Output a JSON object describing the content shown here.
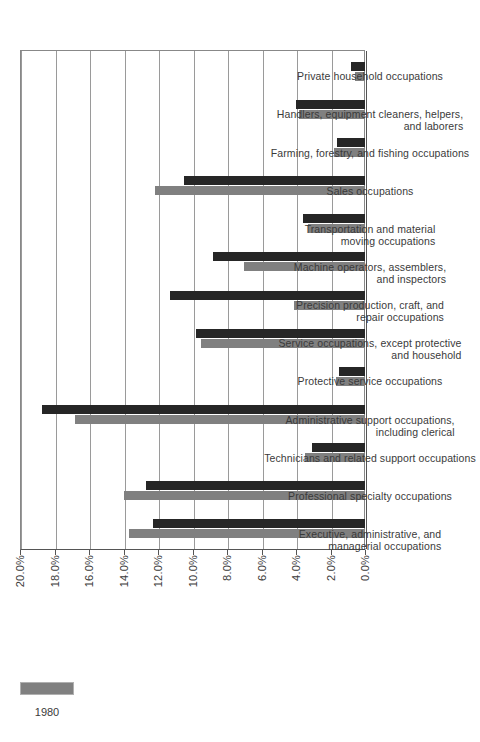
{
  "chart_data": {
    "type": "bar",
    "title": "",
    "xlabel": "",
    "ylabel": "",
    "ylim": [
      0.0,
      20.0
    ],
    "grid": true,
    "legend_position": "bottom-right",
    "ytick_labels": [
      "0.0%",
      "2.0%",
      "4.0%",
      "6.0%",
      "8.0%",
      "10.0%",
      "12.0%",
      "14.0%",
      "16.0%",
      "18.0%",
      "20.0%"
    ],
    "ytick_values": [
      0.0,
      2.0,
      4.0,
      6.0,
      8.0,
      10.0,
      12.0,
      14.0,
      16.0,
      18.0,
      20.0
    ],
    "categories": [
      {
        "line1": "Executive, administrative, and",
        "line2": "managerial occupations"
      },
      {
        "line1": "Professional specialty occupations",
        "line2": ""
      },
      {
        "line1": "Technicians and related support occupations",
        "line2": ""
      },
      {
        "line1": "Administrative support occupations,",
        "line2": "including clerical"
      },
      {
        "line1": "Protective service occupations",
        "line2": ""
      },
      {
        "line1": "Service occupations, except protective",
        "line2": "and household"
      },
      {
        "line1": "Precision production, craft, and",
        "line2": "repair occupations"
      },
      {
        "line1": "Machine operators, assemblers,",
        "line2": "and inspectors"
      },
      {
        "line1": "Transportation and material",
        "line2": "moving occupations"
      },
      {
        "line1": "Sales occupations",
        "line2": ""
      },
      {
        "line1": "Farming, forestry, and fishing occupations",
        "line2": ""
      },
      {
        "line1": "Handlers, equipment cleaners, helpers,",
        "line2": "and laborers"
      },
      {
        "line1": "Private household occupations",
        "line2": ""
      }
    ],
    "series": [
      {
        "name": "1980",
        "color": "#808080",
        "values": [
          13.7,
          14.0,
          3.5,
          16.8,
          1.7,
          9.5,
          4.1,
          7.0,
          3.3,
          12.2,
          1.8,
          3.8,
          0.6
        ]
      },
      {
        "name": "",
        "color": "#262626",
        "values": [
          12.3,
          12.7,
          3.1,
          18.7,
          1.5,
          9.8,
          11.3,
          8.8,
          3.6,
          10.5,
          1.6,
          4.0,
          0.8
        ]
      }
    ]
  },
  "legend": {
    "entries": [
      {
        "label": "1980",
        "color": "#808080"
      }
    ]
  }
}
